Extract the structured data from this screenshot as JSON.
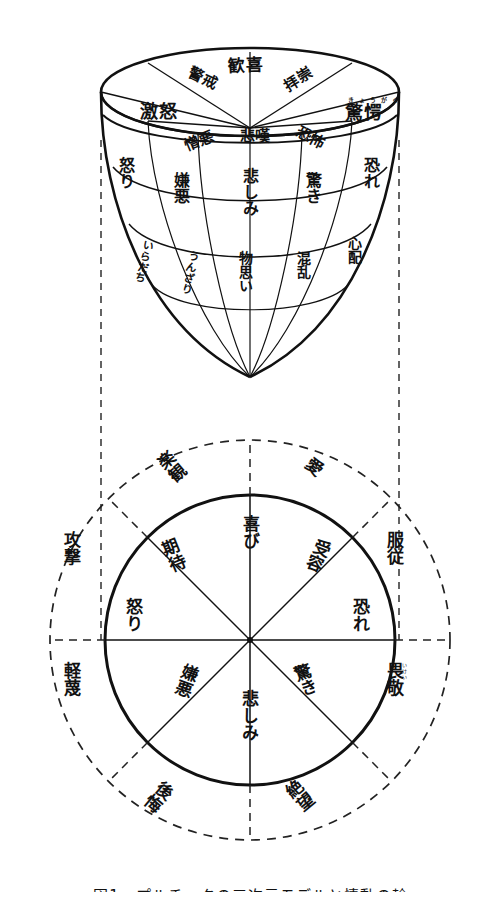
{
  "figure": {
    "caption": "図1　プルチックの三次元モデルと情動の輪",
    "cone": {
      "name": "三次元モデル（円錐）",
      "top_ring": [
        {
          "label": "歓喜",
          "furigana": ""
        },
        {
          "label": "拝崇",
          "furigana": ""
        },
        {
          "label": "驚愕",
          "furigana": "きょうがく"
        },
        {
          "label": "恐怖",
          "furigana": ""
        },
        {
          "label": "悲嘆",
          "furigana": ""
        },
        {
          "label": "憎悪",
          "furigana": ""
        },
        {
          "label": "激怒",
          "furigana": ""
        },
        {
          "label": "警戒",
          "furigana": ""
        }
      ],
      "middle_ring": [
        {
          "label": "怒り"
        },
        {
          "label": "嫌悪"
        },
        {
          "label": "悲しみ"
        },
        {
          "label": "驚き"
        },
        {
          "label": "恐れ"
        }
      ],
      "lower_ring": [
        {
          "label": "いらだち"
        },
        {
          "label": "うんざり"
        },
        {
          "label": "物思い"
        },
        {
          "label": "混乱"
        },
        {
          "label": "心配"
        }
      ]
    },
    "wheel": {
      "name": "情動の輪",
      "inner_sectors": [
        {
          "label": "喜び",
          "position": "top"
        },
        {
          "label": "受容",
          "position": "upper-right"
        },
        {
          "label": "恐れ",
          "position": "right"
        },
        {
          "label": "驚き",
          "position": "lower-right"
        },
        {
          "label": "悲しみ",
          "position": "bottom"
        },
        {
          "label": "嫌悪",
          "position": "lower-left"
        },
        {
          "label": "怒り",
          "position": "left"
        },
        {
          "label": "期待",
          "position": "upper-left"
        }
      ],
      "outer_sectors": [
        {
          "label": "楽観",
          "furigana": "",
          "position": "upper-left"
        },
        {
          "label": "愛",
          "furigana": "",
          "position": "upper-right"
        },
        {
          "label": "服従",
          "furigana": "",
          "position": "right-upper"
        },
        {
          "label": "畏敬",
          "furigana": "いけい",
          "position": "right-lower"
        },
        {
          "label": "絶望",
          "furigana": "",
          "position": "lower-right"
        },
        {
          "label": "後悔",
          "furigana": "",
          "position": "lower-left"
        },
        {
          "label": "軽蔑",
          "furigana": "",
          "position": "left-lower"
        },
        {
          "label": "攻撃",
          "furigana": "",
          "position": "left-upper"
        }
      ]
    }
  },
  "colors": {
    "ink": "#111111",
    "paper": "#ffffff",
    "dash": "#222222"
  }
}
